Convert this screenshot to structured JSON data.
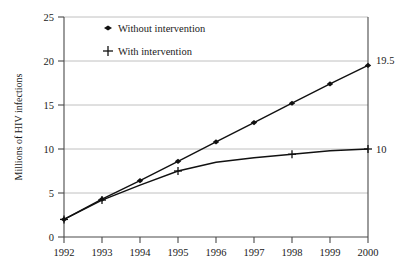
{
  "chart_data": {
    "type": "line",
    "title": "",
    "xlabel": "",
    "ylabel": "Millions of HIV infections",
    "x": [
      1992,
      1993,
      1994,
      1995,
      1996,
      1997,
      1998,
      1999,
      2000
    ],
    "xticklabels": [
      "1992",
      "1993",
      "1994",
      "1995",
      "1996",
      "1997",
      "1998",
      "1999",
      "2000"
    ],
    "yticklabels": [
      "0",
      "5",
      "10",
      "15",
      "20",
      "25"
    ],
    "yticks": [
      0,
      5,
      10,
      15,
      20,
      25
    ],
    "xlim": [
      1992,
      2000
    ],
    "ylim": [
      0,
      25
    ],
    "grid": "horizontal",
    "legend_position": "inside-top-left",
    "series": [
      {
        "name": "Without intervention",
        "marker": "diamond",
        "values": [
          2.0,
          4.3,
          6.4,
          8.6,
          10.8,
          13.0,
          15.2,
          17.4,
          19.5
        ],
        "end_annotation": "19.5"
      },
      {
        "name": "With intervention",
        "marker": "plus",
        "values": [
          2.0,
          4.2,
          5.9,
          7.5,
          8.5,
          9.0,
          9.4,
          9.8,
          10.0
        ],
        "end_annotation": "10",
        "marker_years": [
          1992,
          1993,
          1995,
          1998,
          2000
        ]
      }
    ],
    "annotations": [
      {
        "text": "19.5",
        "at_x": 2000,
        "at_y": 19.5
      },
      {
        "text": "10",
        "at_x": 2000,
        "at_y": 10.0
      }
    ],
    "colors": {
      "line": "#111111",
      "grid": "#b9b9b9",
      "axis": "#4a4a4a",
      "background": "#ffffff"
    }
  },
  "legend": {
    "items": [
      {
        "label": "Without intervention",
        "marker": "diamond-marker"
      },
      {
        "label": "With intervention",
        "marker": "plus-marker"
      }
    ]
  }
}
